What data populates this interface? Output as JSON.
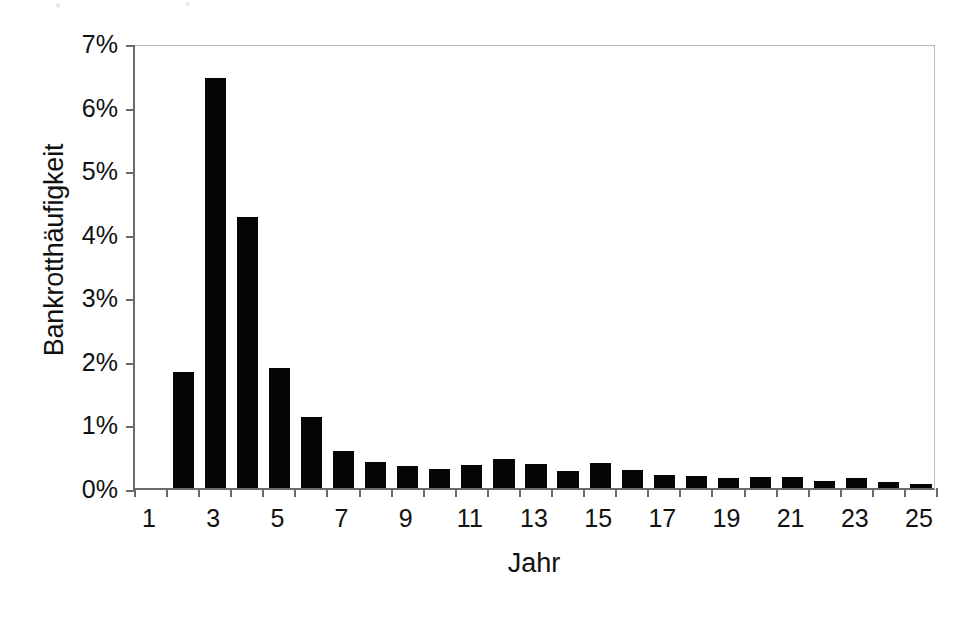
{
  "chart_data": {
    "type": "bar",
    "title": "",
    "subtitle": "",
    "xlabel": "Jahr",
    "ylabel": "Bankrotthäufigkeit",
    "grid": false,
    "legend": null,
    "legend_position": "none",
    "xlim": [
      0.5,
      25.5
    ],
    "ylim": [
      0,
      7
    ],
    "ytick_labels": [
      "0%",
      "1%",
      "2%",
      "3%",
      "4%",
      "5%",
      "6%",
      "7%"
    ],
    "ytick_values": [
      0,
      1,
      2,
      3,
      4,
      5,
      6,
      7
    ],
    "xtick_labels": [
      "1",
      "3",
      "5",
      "7",
      "9",
      "11",
      "13",
      "15",
      "17",
      "19",
      "21",
      "23",
      "25"
    ],
    "xtick_values": [
      1,
      3,
      5,
      7,
      9,
      11,
      13,
      15,
      17,
      19,
      21,
      23,
      25
    ],
    "categories": [
      1,
      2,
      3,
      4,
      5,
      6,
      7,
      8,
      9,
      10,
      11,
      12,
      13,
      14,
      15,
      16,
      17,
      18,
      19,
      20,
      21,
      22,
      23,
      24,
      25
    ],
    "values": [
      0.0,
      1.82,
      6.45,
      4.27,
      1.89,
      1.11,
      0.59,
      0.41,
      0.35,
      0.3,
      0.36,
      0.45,
      0.38,
      0.26,
      0.4,
      0.29,
      0.2,
      0.19,
      0.15,
      0.17,
      0.18,
      0.11,
      0.16,
      0.1,
      0.07
    ],
    "value_unit": "%",
    "bar_color": "#050505",
    "axis_color": "#6a6a6a",
    "frame_color": "#b9b9b9",
    "background": "#ffffff"
  }
}
